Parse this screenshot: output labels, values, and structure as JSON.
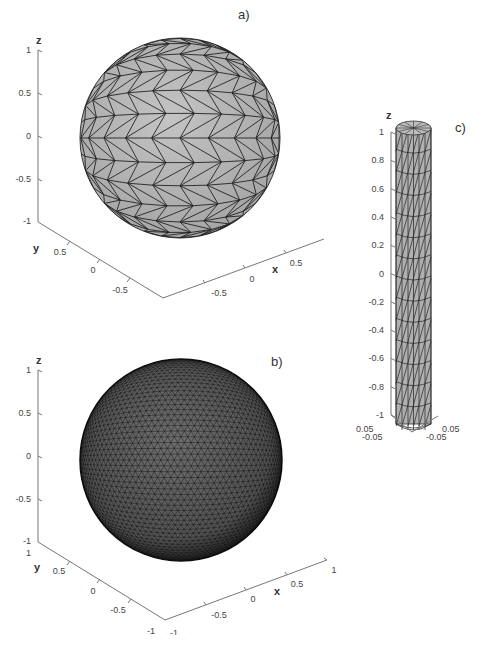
{
  "figure": {
    "panels": [
      {
        "id": "a",
        "label": "a)",
        "description": "Coarse triangulated unit sphere",
        "mesh": "coarse",
        "z_axis": {
          "label": "z",
          "ticks": [
            "1",
            "0.5",
            "0",
            "-0.5",
            "-1"
          ]
        },
        "y_axis": {
          "label": "y",
          "ticks": [
            "0.5",
            "0",
            "-0.5"
          ]
        },
        "x_axis": {
          "label": "x",
          "ticks": [
            "-0.5",
            "0",
            "0.5"
          ]
        },
        "face_color": "#b4b4b4",
        "edge_color": "#222222"
      },
      {
        "id": "b",
        "label": "b)",
        "description": "Fine triangulated unit sphere",
        "mesh": "fine",
        "z_axis": {
          "label": "z",
          "ticks": [
            "1",
            "0.5",
            "0",
            "-0.5",
            "-1"
          ]
        },
        "y_axis": {
          "label": "y",
          "ticks": [
            "1",
            "0.5",
            "0",
            "-0.5",
            "-1"
          ]
        },
        "x_axis": {
          "label": "x",
          "ticks": [
            "-1",
            "-0.5",
            "0",
            "0.5",
            "1"
          ]
        },
        "face_color": "#7a7a7a",
        "edge_color": "#111111"
      },
      {
        "id": "c",
        "label": "c)",
        "description": "Triangulated thin cylinder",
        "mesh": "cylinder",
        "z_axis": {
          "label": "z",
          "ticks": [
            "1",
            "0.8",
            "0.6",
            "0.4",
            "0.2",
            "0",
            "-0.2",
            "-0.4",
            "-0.6",
            "-0.8",
            "-1"
          ]
        },
        "y_axis": {
          "ticks": [
            "0.05",
            "-0.05"
          ]
        },
        "x_axis": {
          "ticks": [
            "0.05",
            "-0.05"
          ]
        },
        "face_color": "#b4b4b4",
        "edge_color": "#222222"
      }
    ]
  }
}
